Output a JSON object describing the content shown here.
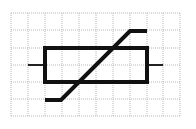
{
  "diagram": {
    "symbol": "variable-resistor (varistor/thermistor) schematic symbol",
    "grid": {
      "x_lines": [
        11,
        28,
        45,
        62,
        79,
        96,
        113,
        130,
        147,
        163,
        180
      ],
      "y_lines": [
        13,
        30,
        48,
        65,
        82,
        99,
        116
      ],
      "color": "#b8b8b8",
      "style": "dotted"
    },
    "body": {
      "x": 45,
      "y": 48,
      "width": 102,
      "height": 34,
      "stroke": "#111111",
      "stroke_width": 4
    },
    "leads": [
      {
        "x1": 28,
        "y1": 65,
        "x2": 45,
        "y2": 65
      },
      {
        "x1": 147,
        "y1": 65,
        "x2": 163,
        "y2": 65
      }
    ],
    "diagonal": {
      "points": [
        [
          45,
          100
        ],
        [
          61,
          100
        ],
        [
          130,
          31
        ],
        [
          147,
          31
        ]
      ],
      "stroke": "#111111",
      "stroke_width": 4
    },
    "label": "Variable resistor symbol"
  }
}
